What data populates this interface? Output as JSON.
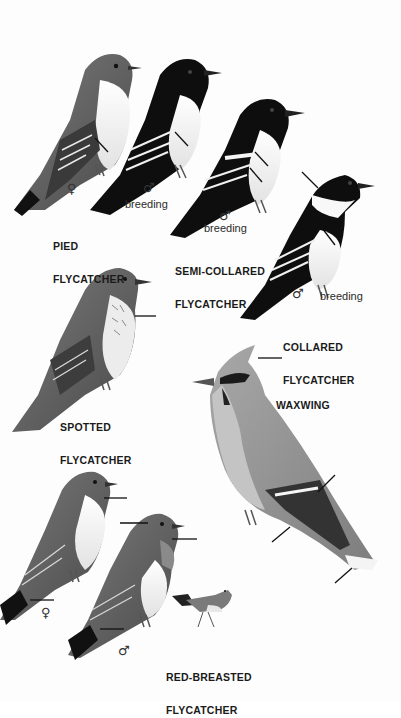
{
  "plate": {
    "species": [
      {
        "id": "pied",
        "name_line1": "PIED",
        "name_line2": "FLYCATCHER",
        "figures": [
          {
            "sex": "♀",
            "note": ""
          },
          {
            "sex": "♂",
            "note": "breeding"
          }
        ]
      },
      {
        "id": "semi-collared",
        "name_line1": "SEMI-COLLARED",
        "name_line2": "FLYCATCHER",
        "figures": [
          {
            "sex": "♂",
            "note": "breeding"
          }
        ]
      },
      {
        "id": "collared",
        "name_line1": "COLLARED",
        "name_line2": "FLYCATCHER",
        "figures": [
          {
            "sex": "♂",
            "note": "breeding"
          }
        ]
      },
      {
        "id": "spotted",
        "name_line1": "SPOTTED",
        "name_line2": "FLYCATCHER",
        "figures": []
      },
      {
        "id": "waxwing",
        "name_line1": "WAXWING",
        "name_line2": "",
        "figures": []
      },
      {
        "id": "red-breasted",
        "name_line1": "RED-BREASTED",
        "name_line2": "FLYCATCHER",
        "figures": [
          {
            "sex": "♀",
            "note": ""
          },
          {
            "sex": "♂",
            "note": ""
          }
        ]
      }
    ]
  },
  "colors": {
    "background": "#fdfdfd",
    "label_text": "#1a1a1a",
    "bird_black": "#0e0e0e",
    "bird_grey": "#6f6f6f",
    "bird_light": "#f2f2f2",
    "waxwing_body": "#9a9a9a"
  }
}
